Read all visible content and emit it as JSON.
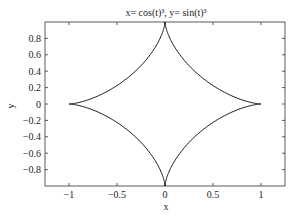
{
  "chart_data": {
    "type": "line",
    "title": "x= cos(t)³, y= sin(t)³",
    "xlabel": "x",
    "ylabel": "y",
    "xlim": [
      -1.25,
      1.25
    ],
    "ylim": [
      -1.0,
      1.0
    ],
    "grid": false,
    "legend": null,
    "x_ticks": [
      -1,
      -0.5,
      0,
      0.5,
      1
    ],
    "x_tick_labels": [
      "−1",
      "−0.5",
      "0",
      "0.5",
      "1"
    ],
    "y_ticks": [
      -0.8,
      -0.6,
      -0.4,
      -0.2,
      0,
      0.2,
      0.4,
      0.6,
      0.8
    ],
    "y_tick_labels": [
      "−0.8",
      "−0.6",
      "−0.4",
      "−0.2",
      "0",
      "0.2",
      "0.4",
      "0.6",
      "0.8"
    ],
    "series": [
      {
        "name": "astroid",
        "parametric": "x=cos(t)^3, y=sin(t)^3, t in [0, 2π]",
        "color": "#000000",
        "key_points": [
          [
            1,
            0
          ],
          [
            0,
            1
          ],
          [
            -1,
            0
          ],
          [
            0,
            -1
          ]
        ]
      }
    ]
  }
}
